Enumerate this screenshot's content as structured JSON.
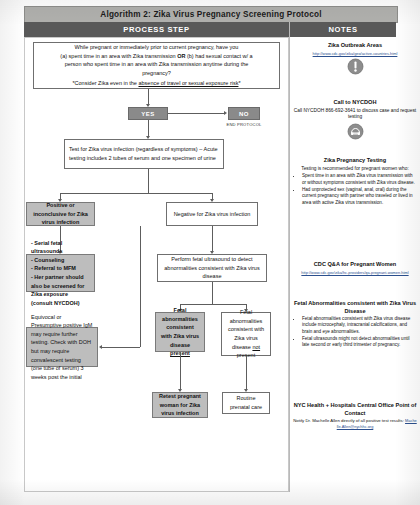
{
  "document": {
    "title": "Algorithm 2: Zika Virus Pregnancy Screening Protocol",
    "columns": {
      "process_step": "PROCESS STEP",
      "notes": "NOTES"
    }
  },
  "flow": {
    "screening_question": {
      "line1": "While pregnant or immediately prior to current pregnancy, have you",
      "line2_a": "(a) spent time in an area with Zika transmission ",
      "line2_or": "OR",
      "line2_b": " (b) had sexual contact w/ a",
      "line3": "person who spent time in an area with Zika transmission anytime during the",
      "line4": "pregnancy?",
      "note_prefix": "*Consider Zika even in the ",
      "note_underline": "absence of travel or sexual exposure risk",
      "note_suffix": "*"
    },
    "yes_chip": "YES",
    "no_chip": "NO",
    "end_protocol_label": "END PROTOCOL",
    "test_box": "Test for Zika virus infection (regardless of symptoms) – Acute testing includes 2 tubes of serum and one specimen of urine",
    "positive_box": "Positive or inconclusive for Zika virus infection",
    "negative_box": "Negative for Zika virus infection",
    "positive_actions": [
      "- Serial fetal ultrasounds",
      "- Counseling",
      "- Referral to MFM",
      "- Her partner should also be screened for Zika exposure (consult NYCDOH)"
    ],
    "equivocal_box": "Equivocal or Presumptive positive IgM may require further testing. Check with DOH but may require convalescent testing (one tube of serum) 3 weeks post the initial",
    "ultrasound_box": "Perform fetal ultrasound to detect abnormalities consistent with Zika virus disease",
    "abnormal_present": {
      "text": "Fetal abnormalities consistent with Zika virus disease ",
      "emphasis": "present"
    },
    "abnormal_absent": {
      "text1": "Fetal abnormalities consistent with Zika virus disease ",
      "emphasis": "not",
      "text2": " present"
    },
    "retest_box": "Retest pregnant woman for Zika virus infection",
    "routine_box": "Routine prenatal care"
  },
  "notes": [
    {
      "id": "zika-outbreak-areas",
      "heading": "Zika Outbreak Areas",
      "url": "http://www.cdc.gov/zika/geo/active-countries.html",
      "icon": "warning-icon"
    },
    {
      "id": "call-to-nycdoh",
      "heading": "Call to NYCDOH",
      "body": "Call NYCDOH 866-692-3641 to discuss case and request testing",
      "icon": "telephone-icon"
    },
    {
      "id": "zika-pregnancy-testing",
      "heading": "Zika Pregnancy Testing",
      "body": "Testing is recommended for pregnant women who:",
      "bullets": [
        "Spent time in an area with Zika virus transmission with or without symptoms consistent with Zika virus disease.",
        "Had unprotected sex (vaginal, anal, oral) during the current pregnancy with partner who traveled or lived in area with active Zika virus transmission."
      ]
    },
    {
      "id": "cdc-qa-pregnant-women",
      "heading": "CDC Q&A for Pregnant Women",
      "url": "http://www.cdc.gov/zika/hc-providers/qa-pregnant-women.html"
    },
    {
      "id": "fetal-abnormalities",
      "heading": "Fetal Abnormalities consistent with Zika Virus Disease",
      "bullets": [
        "Fetal abnormalities consistent with Zika virus disease include microcephaly, intracranial calcifications, and brain and eye abnormalities.",
        "Fetal ultrasounds might not detect abnormalities until late second or early third trimester of pregnancy."
      ]
    },
    {
      "id": "central-office-contact",
      "heading": "NYC Health + Hospitals Central Office Point of Contact",
      "body": "Notify Dr. Machelle Allen directly of all positive test results:",
      "email": "Machelle.Allen@nychhc.org"
    }
  ]
}
